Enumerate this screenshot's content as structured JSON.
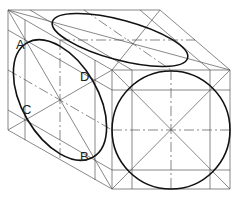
{
  "diagram": {
    "type": "isometric cube with inscribed circle and ellipses",
    "labels": [
      {
        "id": "A",
        "text": "A",
        "x": 16,
        "y": 38
      },
      {
        "id": "D",
        "text": "D",
        "x": 80,
        "y": 70
      },
      {
        "id": "C",
        "text": "C",
        "x": 22,
        "y": 103
      },
      {
        "id": "B",
        "text": "B",
        "x": 80,
        "y": 150
      }
    ],
    "colors": {
      "stroke": "#111111",
      "construction": "#555555",
      "background": "#ffffff"
    }
  }
}
